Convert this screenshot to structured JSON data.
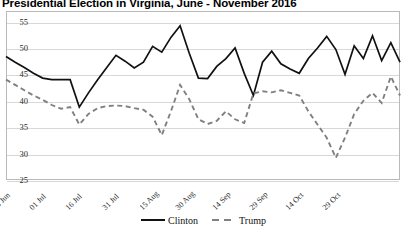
{
  "chart_data": {
    "type": "line",
    "title": "Presidential Election in Virginia, June - November 2016",
    "xlabel": "",
    "ylabel": "",
    "ylim": [
      25,
      57
    ],
    "yticks": [
      25,
      30,
      35,
      40,
      45,
      50,
      55
    ],
    "grid": true,
    "legend_position": "bottom-center",
    "x_tick_labels": [
      "16 Jun",
      "01 Jul",
      "16 Jul",
      "31 Jul",
      "15 Aug",
      "30 Aug",
      "14 Sep",
      "29 Sep",
      "14 Oct",
      "29 Oct"
    ],
    "x_tick_indices": [
      0,
      4,
      8,
      12,
      16,
      20,
      24,
      28,
      32,
      36
    ],
    "x_count": 40,
    "series": [
      {
        "name": "Clinton",
        "color": "#111111",
        "style": "solid",
        "values": [
          48.4,
          47.3,
          46.3,
          45.2,
          44.3,
          44.0,
          44.0,
          44.0,
          38.8,
          41.5,
          44.0,
          46.3,
          48.6,
          47.5,
          46.2,
          47.3,
          50.3,
          49.2,
          52.0,
          54.2,
          49.0,
          44.3,
          44.2,
          46.5,
          48.0,
          50.0,
          45.2,
          41.0,
          47.3,
          49.4,
          47.0,
          46.0,
          45.2,
          48.0,
          50.0,
          52.2,
          49.7,
          45.0,
          50.4,
          48.0,
          52.3,
          47.6,
          51.0,
          47.3
        ]
      },
      {
        "name": "Trump",
        "color": "#808080",
        "style": "dashed",
        "values": [
          44.0,
          43.0,
          42.0,
          41.0,
          40.2,
          39.2,
          38.5,
          38.8,
          35.5,
          37.5,
          38.6,
          39.0,
          39.1,
          39.0,
          38.6,
          38.3,
          37.0,
          33.5,
          38.0,
          43.0,
          40.3,
          36.5,
          35.6,
          36.2,
          38.0,
          36.5,
          35.8,
          41.4,
          41.8,
          41.6,
          42.0,
          41.5,
          41.0,
          38.0,
          35.5,
          33.0,
          29.2,
          33.0,
          37.5,
          40.0,
          41.5,
          39.6,
          44.6,
          41.0
        ]
      }
    ]
  },
  "legend": {
    "items": [
      {
        "label": "Clinton"
      },
      {
        "label": "Trump"
      }
    ]
  }
}
